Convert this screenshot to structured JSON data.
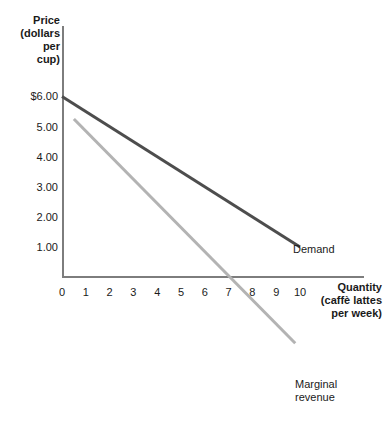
{
  "chart_data": {
    "type": "line",
    "title": "",
    "xlabel": "Quantity\n(caffè lattes\nper week)",
    "ylabel": "Price\n(dollars\nper\ncup)",
    "xlim": [
      0,
      10.6
    ],
    "ylim": [
      0,
      6.6
    ],
    "grid": false,
    "legend_position": "inline-end-labels",
    "x_ticks": [
      "0",
      "1",
      "2",
      "3",
      "4",
      "5",
      "6",
      "7",
      "8",
      "9",
      "10"
    ],
    "x_tick_values": [
      0,
      1,
      2,
      3,
      4,
      5,
      6,
      7,
      8,
      9,
      10
    ],
    "y_ticks": [
      "$6.00",
      "5.00",
      "4.00",
      "3.00",
      "2.00",
      "1.00"
    ],
    "y_tick_values": [
      6,
      5,
      4,
      3,
      2,
      1
    ],
    "series": [
      {
        "name": "Demand",
        "color": "#4d4d4d",
        "points": [
          [
            0,
            6.0
          ],
          [
            10,
            1.0
          ]
        ]
      },
      {
        "name": "Marginal\nrevenue",
        "color": "#b3b3b3",
        "points": [
          [
            0.5,
            5.25
          ],
          [
            9.8,
            -2.2
          ]
        ]
      }
    ],
    "annotations": [
      {
        "text": "Demand",
        "x": 10,
        "y": 1.0
      },
      {
        "text": "Marginal\nrevenue",
        "x": 9.8,
        "y": -2.2
      }
    ],
    "axis_color": "#7d7d7d"
  }
}
